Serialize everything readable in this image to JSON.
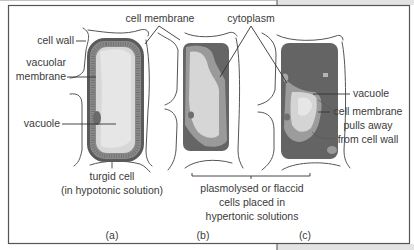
{
  "figure": {
    "labels": {
      "cell_membrane_top": "cell membrane",
      "cytoplasm": "cytoplasm",
      "cell_wall": "cell wall",
      "vacuolar_membrane_line1": "vacuolar",
      "vacuolar_membrane_line2": "membrane",
      "vacuole_left": "vacuole",
      "vacuole_right": "vacuole",
      "membrane_pulls_line1": "cell membrane",
      "membrane_pulls_line2": "pulls away",
      "membrane_pulls_line3": "from cell wall"
    },
    "captions": {
      "a_line1": "turgid cell",
      "a_line2": "(in hypotonic solution)",
      "bc_line1": "plasmolysed or flaccid",
      "bc_line2": "cells placed in",
      "bc_line3": "hypertonic solutions"
    },
    "panels": [
      {
        "id": "a",
        "label": "(a)"
      },
      {
        "id": "b",
        "label": "(b)"
      },
      {
        "id": "c",
        "label": "(c)"
      }
    ],
    "colors": {
      "cytoplasm_dark": "#6b6b6b",
      "cytoplasm_mid": "#9a9a9a",
      "vacuole_light": "#d9d9d9",
      "vacuole_pale": "#ebebeb",
      "membrane_dark": "#4d4d4d",
      "frame_gray": "#e3e3e3"
    }
  }
}
